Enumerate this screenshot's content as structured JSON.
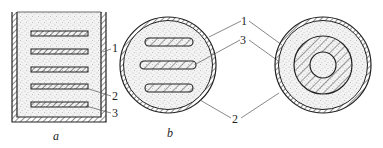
{
  "diagram": {
    "figures": [
      {
        "id": "a",
        "caption": "a",
        "shape": "rectangular container with five horizontal plates",
        "labels": [
          "1",
          "2",
          "3"
        ]
      },
      {
        "id": "b",
        "caption": "b",
        "shape": "circular cross-section with three horizontal plates",
        "labels": [
          "1",
          "3",
          "2"
        ]
      },
      {
        "id": "c",
        "caption": "",
        "shape": "concentric circular cross-section",
        "labels": []
      }
    ],
    "legend": {
      "1": "1",
      "2": "2",
      "3": "3"
    },
    "colors": {
      "line": "#222222",
      "leader": "#555555",
      "fill_stipple": "#e6e6e6",
      "background": "#ffffff"
    }
  }
}
